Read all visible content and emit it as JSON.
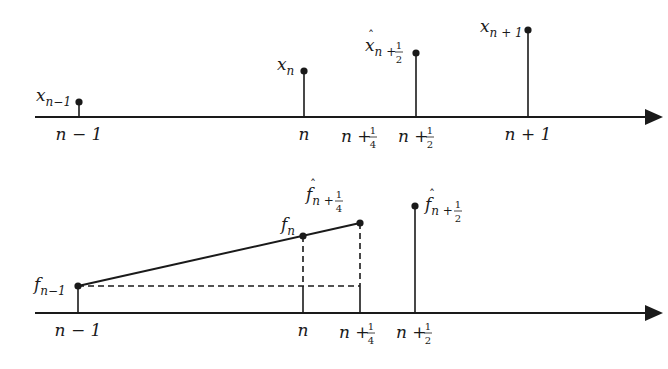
{
  "figure": {
    "colors": {
      "ink": "#1a1a1a",
      "background": "#ffffff"
    }
  },
  "top_panel": {
    "axis_labels": [
      {
        "id": "n-1",
        "main": "n − 1",
        "frac": null
      },
      {
        "id": "n",
        "main": "n",
        "frac": null
      },
      {
        "id": "n+1/4",
        "main": "n + ",
        "frac": {
          "num": "1",
          "den": "4"
        }
      },
      {
        "id": "n+1/2",
        "main": "n + ",
        "frac": {
          "num": "1",
          "den": "2"
        }
      },
      {
        "id": "n+1",
        "main": "n + 1",
        "frac": null
      }
    ],
    "samples": [
      {
        "id": "x_n-1",
        "base": "x",
        "sub": "n−1",
        "hat": false,
        "frac": null
      },
      {
        "id": "x_n",
        "base": "x",
        "sub": "n",
        "hat": false,
        "frac": null
      },
      {
        "id": "xhat_n+1/2",
        "base": "x",
        "sub": "n + ",
        "hat": true,
        "frac": {
          "num": "1",
          "den": "2"
        }
      },
      {
        "id": "x_n+1",
        "base": "x",
        "sub": "n + 1",
        "hat": false,
        "frac": null
      }
    ]
  },
  "bottom_panel": {
    "axis_labels": [
      {
        "id": "n-1",
        "main": "n − 1",
        "frac": null
      },
      {
        "id": "n",
        "main": "n",
        "frac": null
      },
      {
        "id": "n+1/4",
        "main": "n + ",
        "frac": {
          "num": "1",
          "den": "4"
        }
      },
      {
        "id": "n+1/2",
        "main": "n + ",
        "frac": {
          "num": "1",
          "den": "2"
        }
      }
    ],
    "samples": [
      {
        "id": "f_n-1",
        "base": "f",
        "sub": "n−1",
        "hat": false,
        "frac": null
      },
      {
        "id": "f_n",
        "base": "f",
        "sub": "n",
        "hat": false,
        "frac": null
      },
      {
        "id": "fhat_n+1/4",
        "base": "f",
        "sub": "n + ",
        "hat": true,
        "frac": {
          "num": "1",
          "den": "4"
        }
      },
      {
        "id": "fhat_n+1/2",
        "base": "f",
        "sub": "n + ",
        "hat": true,
        "frac": {
          "num": "1",
          "den": "2"
        }
      }
    ]
  }
}
